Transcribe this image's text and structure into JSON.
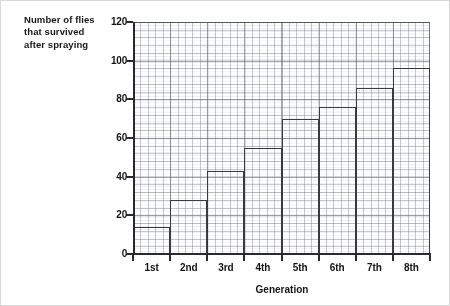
{
  "page": {
    "background_color": "#ffffff",
    "ink_color": "#1a1a1a"
  },
  "y_caption": {
    "line1": "Number of flies",
    "line2": "that survived",
    "line3": "after spraying"
  },
  "x_title": "Generation",
  "chart_data": {
    "type": "bar",
    "title": "",
    "subtitle": "",
    "xlabel": "Generation",
    "ylabel": "Number of flies that survived after spraying",
    "categories": [
      "1st",
      "2nd",
      "3rd",
      "4th",
      "5th",
      "6th",
      "7th",
      "8th"
    ],
    "values": [
      14,
      28,
      43,
      55,
      70,
      76,
      86,
      96
    ],
    "series": [
      {
        "name": "Flies surviving after spraying",
        "values": [
          14,
          28,
          43,
          55,
          70,
          76,
          86,
          96
        ]
      }
    ],
    "ylim": [
      0,
      120
    ],
    "xlim": [
      0,
      8
    ],
    "y_ticks": [
      0,
      20,
      40,
      60,
      80,
      100,
      120
    ],
    "y_tick_labels": [
      "0",
      "20",
      "40",
      "60",
      "80",
      "100",
      "120"
    ],
    "x_tick_labels": [
      "1st",
      "2nd",
      "3rd",
      "4th",
      "5th",
      "6th",
      "7th",
      "8th"
    ],
    "grid": true,
    "grid_style": "graph-paper dotted minor with solid major lines",
    "legend": false,
    "legend_position": "none",
    "bar_style": "outline only, adjacent bars sharing edges (step histogram)",
    "bar_color": "#3a3a3a",
    "annotations": []
  }
}
